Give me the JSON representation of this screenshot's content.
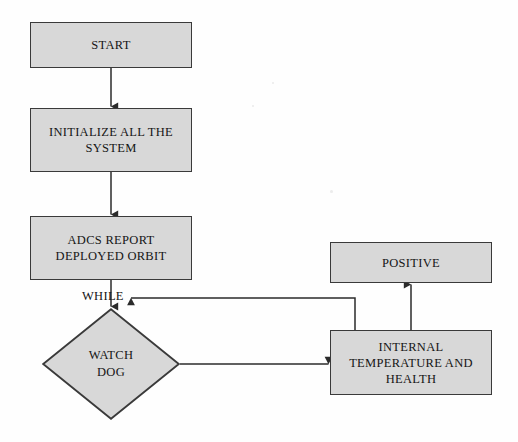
{
  "diagram": {
    "background_color": "#fefefe",
    "node_fill_color": "#d8d8d8",
    "node_border_color": "#3a3a3a",
    "line_color": "#2b2b2b",
    "nodes": [
      {
        "id": "start",
        "shape": "process",
        "label": "START"
      },
      {
        "id": "initialize",
        "shape": "process",
        "label": "INITIALIZE ALL THE\nSYSTEM"
      },
      {
        "id": "adcs",
        "shape": "process",
        "label": "ADCS REPORT\nDEPLOYED ORBIT"
      },
      {
        "id": "watchdog",
        "shape": "decision",
        "label": "WATCH\nDOG"
      },
      {
        "id": "internaltemp",
        "shape": "process",
        "label": "INTERNAL\nTEMPERATURE AND\nHEALTH"
      },
      {
        "id": "positive",
        "shape": "process",
        "label": "POSITIVE"
      }
    ],
    "edge_labels": [
      {
        "id": "while",
        "label": "WHILE"
      }
    ],
    "edges": [
      {
        "from": "start",
        "to": "initialize",
        "label": ""
      },
      {
        "from": "initialize",
        "to": "adcs",
        "label": ""
      },
      {
        "from": "adcs",
        "to": "watchdog",
        "label": "WHILE"
      },
      {
        "from": "watchdog",
        "to": "internaltemp",
        "label": ""
      },
      {
        "from": "internaltemp",
        "to": "positive",
        "label": ""
      },
      {
        "from": "internaltemp",
        "to": "watchdog",
        "label": ""
      }
    ]
  }
}
